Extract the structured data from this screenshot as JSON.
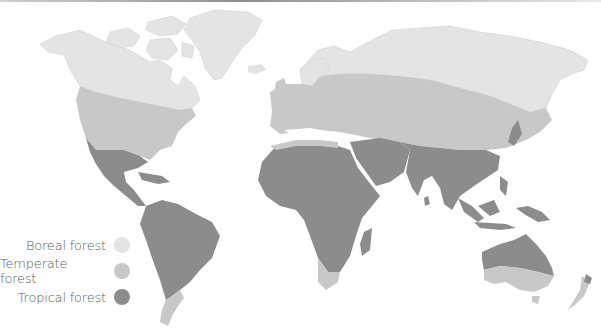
{
  "map": {
    "type": "world-choropleth",
    "subject": "Forest biome distribution",
    "colors": {
      "land_boreal": "#e4e4e4",
      "land_temperate": "#c8c8c8",
      "land_tropical": "#8c8c8c",
      "ocean": "#ffffff"
    }
  },
  "legend": {
    "items": [
      {
        "label": "Boreal forest",
        "color": "#e4e4e4"
      },
      {
        "label": "Temperate forest",
        "color": "#c8c8c8"
      },
      {
        "label": "Tropical forest",
        "color": "#8c8c8c"
      }
    ]
  }
}
